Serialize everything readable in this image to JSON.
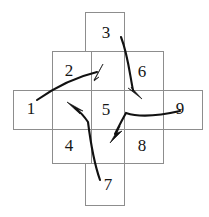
{
  "diagram": {
    "background_color": "#ffffff",
    "grid_line_color": "#8d8d8d",
    "arrow_color": "#111111",
    "label_color": "#161616",
    "cells": [
      {
        "id": "cell-1",
        "label": "1",
        "column": 0,
        "row": 1,
        "x": 13,
        "y": 90,
        "w": 39,
        "h": 39,
        "label_x": 31,
        "label_y": 110
      },
      {
        "id": "cell-2",
        "label": "2",
        "column": 1,
        "row": 0,
        "x": 52,
        "y": 51,
        "w": 39,
        "h": 39,
        "label_x": 69,
        "label_y": 72
      },
      {
        "id": "cell-3",
        "label": "3",
        "column": 2,
        "row": 0,
        "x": 85,
        "y": 12,
        "w": 39,
        "h": 39,
        "label_x": 106,
        "label_y": 34
      },
      {
        "id": "cell-4",
        "label": "4",
        "column": 1,
        "row": 2,
        "x": 52,
        "y": 129,
        "w": 39,
        "h": 34,
        "label_x": 69,
        "label_y": 147
      },
      {
        "id": "cell-5",
        "label": "5",
        "column": 1,
        "row": 1,
        "x": 91,
        "y": 90,
        "w": 33,
        "h": 39,
        "label_x": 106,
        "label_y": 111
      },
      {
        "id": "cell-6",
        "label": "6",
        "column": 2,
        "row": 0,
        "x": 124,
        "y": 51,
        "w": 39,
        "h": 39,
        "label_x": 142,
        "label_y": 73
      },
      {
        "id": "cell-7",
        "label": "7",
        "column": 1,
        "row": 3,
        "x": 85,
        "y": 163,
        "w": 39,
        "h": 42,
        "label_x": 108,
        "label_y": 186
      },
      {
        "id": "cell-8",
        "label": "8",
        "column": 2,
        "row": 2,
        "x": 124,
        "y": 129,
        "w": 39,
        "h": 34,
        "label_x": 142,
        "label_y": 147
      },
      {
        "id": "cell-9",
        "label": "9",
        "column": 3,
        "row": 1,
        "x": 163,
        "y": 90,
        "w": 39,
        "h": 39,
        "label_x": 180,
        "label_y": 110
      }
    ],
    "arrows": [
      {
        "id": "arrow-from-1",
        "from_label": "1",
        "to_label": "2",
        "description": "curve starting near cell 1 sweeping right and up, arrowhead pointing up-right into cell 2",
        "path": "M 37,100 C 57,86 80,76 97,72",
        "head_points": "103,64 94,80 99,77 94,81"
      },
      {
        "id": "arrow-from-3",
        "from_label": "3",
        "to_label": "6",
        "description": "curve starting below numeral 3 descending through cell 6, arrowhead pointing down-right",
        "path": "M 121,37 C 128,55 130,76 133,90",
        "head_points": "142,99 128,88 134,92 131,87"
      },
      {
        "id": "arrow-from-9",
        "from_label": "9",
        "to_label": "8",
        "description": "curve starting left of numeral 9 sweeping left then turning down, arrowhead pointing down-left into cell 8",
        "path": "M 180,111 C 158,116 138,117 126,113 C 122,120 118,128 115,134",
        "head_points": "110,143 120,126 117,133 122,131"
      },
      {
        "id": "arrow-from-7",
        "from_label": "7",
        "to_label": "4",
        "description": "curve starting above numeral 7 rising and bending left, arrowhead pointing up-left into cell 4/5 boundary",
        "path": "M 100,180 C 93,160 90,138 88,122 C 84,116 79,111 75,108",
        "head_points": "67,102 83,111 76,109 80,114"
      }
    ]
  }
}
